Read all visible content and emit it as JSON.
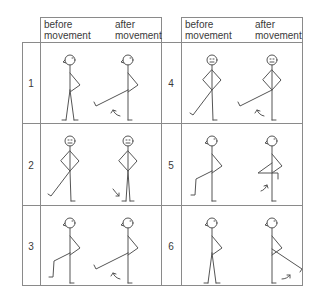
{
  "headers": {
    "left": {
      "before": [
        "before",
        "movement"
      ],
      "after": [
        "after",
        "movement"
      ]
    },
    "right": {
      "before": [
        "before",
        "movement"
      ],
      "after": [
        "after",
        "movement"
      ]
    }
  },
  "rows": [
    {
      "number": "1",
      "panel": "left",
      "face": "profile",
      "before_pose": "standing",
      "after_pose": "leg-raised-forward-straight",
      "arrow": "up"
    },
    {
      "number": "2",
      "panel": "left",
      "face": "front",
      "before_pose": "leg-back-diagonal",
      "after_pose": "legs-together",
      "arrow": "down"
    },
    {
      "number": "3",
      "panel": "left",
      "face": "profile",
      "before_pose": "knee-bent-back",
      "after_pose": "leg-raised-forward-straight",
      "arrow": "up"
    },
    {
      "number": "4",
      "panel": "right",
      "face": "front",
      "before_pose": "leg-back-diagonal",
      "after_pose": "leg-raised-forward-straight",
      "arrow": "up"
    },
    {
      "number": "5",
      "panel": "right",
      "face": "profile",
      "before_pose": "knee-bent-back",
      "after_pose": "knee-raised-forward",
      "arrow": "up"
    },
    {
      "number": "6",
      "panel": "right",
      "face": "profile",
      "before_pose": "standing",
      "after_pose": "leg-raised-backward",
      "arrow": "up"
    }
  ],
  "colors": {
    "line": "#555555",
    "grid": "#8a8a8a"
  }
}
